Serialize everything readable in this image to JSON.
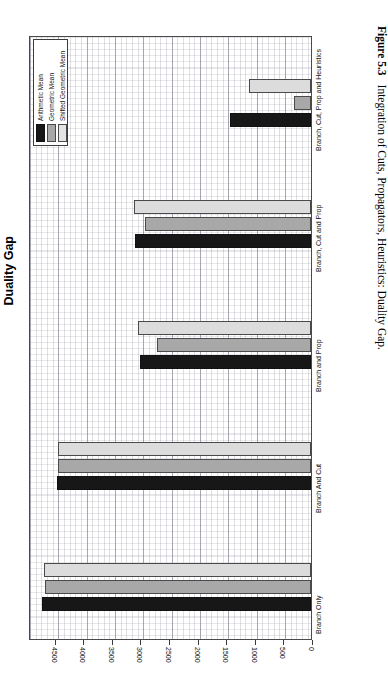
{
  "figure": {
    "number_label": "Figure 5.3",
    "caption_text": "Integration of Cuts, Propagators, Heuristics: Duality Gap."
  },
  "chart": {
    "title": "Duality Gap",
    "legend": {
      "position": "top-left",
      "items": [
        {
          "label": "Arithmetic Mean",
          "color": "#171717",
          "key": "arithmetic"
        },
        {
          "label": "Geometric Mean",
          "color": "#a8a8a8",
          "key": "geometric"
        },
        {
          "label": "Shifted Geometric Mean",
          "color": "#e4e4e4",
          "key": "shifted_geometric"
        }
      ]
    },
    "value_axis": {
      "ticks": [
        "4500",
        "4000",
        "3500",
        "3000",
        "2500",
        "2000",
        "1500",
        "1000",
        "500",
        "0"
      ],
      "direction": "right-to-left",
      "min": 0,
      "max": 4950
    }
  },
  "chart_data": {
    "type": "bar",
    "orientation": "horizontal",
    "title": "Duality Gap",
    "xlabel": "",
    "ylabel": "",
    "xlim": [
      0,
      4950
    ],
    "grid": true,
    "legend_position": "top-left",
    "categories": [
      "Branch Only",
      "Branch And Cut",
      "Branch and Prop",
      "Branch, Cut and Prop",
      "Branch, Cut, Prop and Heuristics"
    ],
    "series": [
      {
        "name": "Arithmetic Mean",
        "color": "#171717",
        "values": [
          4710,
          4440,
          2990,
          3080,
          1410
        ]
      },
      {
        "name": "Geometric Mean",
        "color": "#a8a8a8",
        "values": [
          4650,
          4430,
          2700,
          2910,
          300
        ]
      },
      {
        "name": "Shifted Geometric Mean",
        "color": "#e4e4e4",
        "values": [
          4670,
          4420,
          3030,
          3100,
          1090
        ]
      }
    ]
  }
}
